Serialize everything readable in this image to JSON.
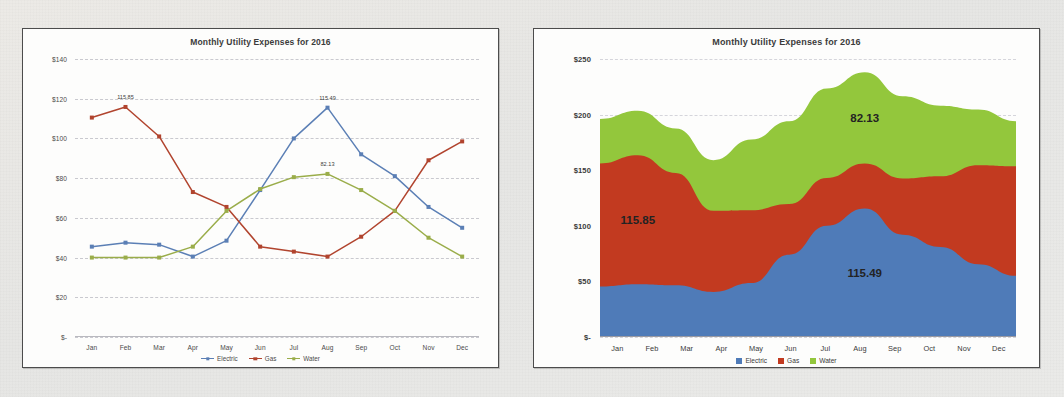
{
  "page": {
    "background_color": "#e9e9e7"
  },
  "colors": {
    "electric": "#5b7fb5",
    "gas": "#b1442e",
    "water": "#9aad4a",
    "electric_area": "#4f7bb8",
    "gas_area": "#c23a20",
    "water_area": "#93c73c",
    "grid": "#c9c9cf",
    "frame": "#4c4c4c"
  },
  "charts": [
    {
      "id": "left-line-chart",
      "title": "Monthly Utility Expenses for 2016",
      "yticks": [
        "$140",
        "$120",
        "$100",
        "$80",
        "$60",
        "$40",
        "$20",
        "$-"
      ],
      "xlabels": [
        "Jan",
        "Feb",
        "Mar",
        "Apr",
        "May",
        "Jun",
        "Jul",
        "Aug",
        "Sep",
        "Oct",
        "Nov",
        "Dec"
      ],
      "legend": [
        "Electric",
        "Gas",
        "Water"
      ],
      "data_labels": [
        {
          "text": "115.85",
          "series": "Gas",
          "category": "Feb"
        },
        {
          "text": "115.49",
          "series": "Electric",
          "category": "Aug"
        },
        {
          "text": "82.13",
          "series": "Water",
          "category": "Aug"
        }
      ]
    },
    {
      "id": "right-area-chart",
      "title": "Monthly Utility Expenses for 2016",
      "yticks": [
        "$250",
        "$200",
        "$150",
        "$100",
        "$50",
        "$-"
      ],
      "xlabels": [
        "Jan",
        "Feb",
        "Mar",
        "Apr",
        "May",
        "Jun",
        "Jul",
        "Aug",
        "Sep",
        "Oct",
        "Nov",
        "Dec"
      ],
      "legend": [
        "Electric",
        "Gas",
        "Water"
      ],
      "data_labels": [
        {
          "text": "115.85",
          "series": "Gas",
          "category": "Feb"
        },
        {
          "text": "82.13",
          "series": "Water",
          "category": "Aug"
        },
        {
          "text": "115.49",
          "series": "Electric",
          "category": "Aug"
        }
      ]
    }
  ],
  "chart_data": [
    {
      "type": "line",
      "title": "Monthly Utility Expenses for 2016",
      "xlabel": "",
      "ylabel": "",
      "categories": [
        "Jan",
        "Feb",
        "Mar",
        "Apr",
        "May",
        "Jun",
        "Jul",
        "Aug",
        "Sep",
        "Oct",
        "Nov",
        "Dec"
      ],
      "ylim": [
        0,
        140
      ],
      "yticks": [
        0,
        20,
        40,
        60,
        80,
        100,
        120,
        140
      ],
      "ytick_labels": [
        "$-",
        "$20",
        "$40",
        "$60",
        "$80",
        "$100",
        "$120",
        "$140"
      ],
      "grid": true,
      "legend_position": "bottom",
      "series": [
        {
          "name": "Electric",
          "color": "#5b7fb5",
          "values": [
            45.5,
            47.5,
            46.5,
            40.5,
            48.5,
            74.0,
            100.0,
            115.49,
            92.0,
            81.0,
            65.5,
            55.0
          ]
        },
        {
          "name": "Gas",
          "color": "#b1442e",
          "values": [
            110.5,
            115.85,
            101.0,
            73.0,
            65.5,
            45.5,
            43.0,
            40.5,
            50.5,
            63.5,
            89.0,
            98.5
          ]
        },
        {
          "name": "Water",
          "color": "#9aad4a",
          "values": [
            40.0,
            40.0,
            40.0,
            45.5,
            63.5,
            74.5,
            80.5,
            82.13,
            74.0,
            63.5,
            50.0,
            40.5
          ]
        }
      ],
      "annotations": [
        {
          "text": "115.85",
          "series": "Gas",
          "category": "Feb"
        },
        {
          "text": "115.49",
          "series": "Electric",
          "category": "Aug"
        },
        {
          "text": "82.13",
          "series": "Water",
          "category": "Aug"
        }
      ]
    },
    {
      "type": "area",
      "stacked": true,
      "title": "Monthly Utility Expenses for 2016",
      "xlabel": "",
      "ylabel": "",
      "categories": [
        "Jan",
        "Feb",
        "Mar",
        "Apr",
        "May",
        "Jun",
        "Jul",
        "Aug",
        "Sep",
        "Oct",
        "Nov",
        "Dec"
      ],
      "ylim": [
        0,
        250
      ],
      "yticks": [
        0,
        50,
        100,
        150,
        200,
        250
      ],
      "ytick_labels": [
        "$-",
        "$50",
        "$100",
        "$150",
        "$200",
        "$250"
      ],
      "grid": true,
      "legend_position": "bottom",
      "series": [
        {
          "name": "Electric",
          "color": "#4f7bb8",
          "values": [
            45.5,
            47.5,
            46.5,
            40.5,
            48.5,
            74.0,
            100.0,
            115.49,
            92.0,
            81.0,
            65.5,
            55.0
          ]
        },
        {
          "name": "Gas",
          "color": "#c23a20",
          "values": [
            110.5,
            115.85,
            101.0,
            73.0,
            65.5,
            45.5,
            43.0,
            40.5,
            50.5,
            63.5,
            89.0,
            98.5
          ]
        },
        {
          "name": "Water",
          "color": "#93c73c",
          "values": [
            40.0,
            40.0,
            40.0,
            45.5,
            63.5,
            74.5,
            80.5,
            82.13,
            74.0,
            63.5,
            50.0,
            40.5
          ]
        }
      ],
      "annotations": [
        {
          "text": "115.85",
          "series": "Gas",
          "category": "Feb"
        },
        {
          "text": "82.13",
          "series": "Water",
          "category": "Aug"
        },
        {
          "text": "115.49",
          "series": "Electric",
          "category": "Aug"
        }
      ]
    }
  ]
}
